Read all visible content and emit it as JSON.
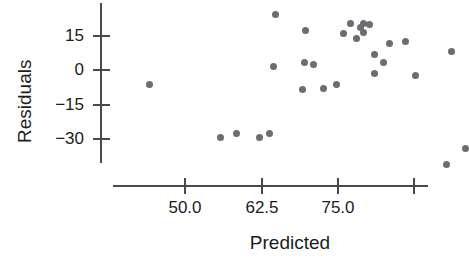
{
  "chart_data": {
    "type": "scatter",
    "title": "",
    "xlabel": "Predicted",
    "ylabel": "Residuals",
    "xticks": [
      "50.0",
      "62.5",
      "75.0"
    ],
    "xtick_values": [
      50.0,
      62.5,
      75.0
    ],
    "yticks": [
      "15",
      "0",
      "−15",
      "−30"
    ],
    "ytick_values": [
      15,
      0,
      -15,
      -30
    ],
    "xlim": [
      44.0,
      89.5
    ],
    "ylim": [
      -38,
      26
    ],
    "grid": false,
    "legend": null,
    "marker": {
      "shape": "circle",
      "color": "#6c6c72",
      "size": 7
    },
    "points": [
      {
        "x": 44.2,
        "y": -6.1
      },
      {
        "x": 55.9,
        "y": -29.7
      },
      {
        "x": 58.4,
        "y": -27.6
      },
      {
        "x": 62.3,
        "y": -29.3
      },
      {
        "x": 63.8,
        "y": -27.6
      },
      {
        "x": 64.9,
        "y": 24.5
      },
      {
        "x": 69.8,
        "y": 17.1
      },
      {
        "x": 64.6,
        "y": 1.7
      },
      {
        "x": 69.6,
        "y": 3.5
      },
      {
        "x": 71.1,
        "y": 2.6
      },
      {
        "x": 69.3,
        "y": -8.3
      },
      {
        "x": 72.7,
        "y": -7.9
      },
      {
        "x": 74.9,
        "y": -6.1
      },
      {
        "x": 78.8,
        "y": 18.4
      },
      {
        "x": 82.6,
        "y": 3.5
      },
      {
        "x": 80.3,
        "y": 20.1
      },
      {
        "x": 77.2,
        "y": 20.5
      },
      {
        "x": 76.1,
        "y": 16.2
      },
      {
        "x": 79.3,
        "y": 20.5
      },
      {
        "x": 79.3,
        "y": 16.6
      },
      {
        "x": 78.2,
        "y": 14.0
      },
      {
        "x": 81.1,
        "y": 7.0
      },
      {
        "x": 81.1,
        "y": -1.7
      },
      {
        "x": 83.6,
        "y": 11.8
      },
      {
        "x": 86.2,
        "y": 12.7
      },
      {
        "x": 87.9,
        "y": -2.6
      },
      {
        "x": 93.7,
        "y": 7.9
      },
      {
        "x": 96.0,
        "y": -34.1
      },
      {
        "x": 92.9,
        "y": -41.1
      }
    ]
  },
  "axes": {
    "y_title": "Residuals",
    "x_title": "Predicted",
    "y_labels": [
      "15",
      "0",
      "−15",
      "−30"
    ],
    "x_labels": [
      "50.0",
      "62.5",
      "75.0"
    ]
  }
}
